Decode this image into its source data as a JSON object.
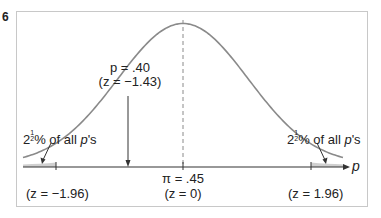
{
  "figure": {
    "corner_mark": "6",
    "x_axis_symbol": "p",
    "center_label_line1": "π = .45",
    "center_label_line2": "(z = 0)",
    "left_z_label": "(z = −1.96)",
    "right_z_label": "(z = 1.96)",
    "sample_label_line1": "p = .40",
    "sample_label_line2": "(z = −1.43)",
    "left_tail_label": {
      "whole": "2",
      "num": "1",
      "den": "2",
      "rest": "% of all ",
      "var": "p",
      "suffix": "'s"
    },
    "right_tail_label": {
      "whole": "2",
      "num": "1",
      "den": "2",
      "rest": "% of all ",
      "var": "p",
      "suffix": "'s"
    }
  },
  "colors": {
    "curve": "#8a8a8a",
    "axis": "#333333",
    "frame": "#c8c8c8",
    "tail_fill": "#d0d0d0",
    "dashed": "#8a8a8a"
  },
  "chart_data": {
    "type": "line",
    "xlabel": "p",
    "ylabel": "",
    "distribution": "normal",
    "mean_label": "π = .45",
    "annotations": [
      {
        "text": "p = .40 (z = −1.43)",
        "z": -1.43
      },
      {
        "text": "2½% of all p's",
        "region": "z < −1.96"
      },
      {
        "text": "2½% of all p's",
        "region": "z > 1.96"
      },
      {
        "text": "(z = −1.96)",
        "z": -1.96
      },
      {
        "text": "(z = 0)",
        "z": 0
      },
      {
        "text": "(z = 1.96)",
        "z": 1.96
      }
    ],
    "grid": false
  }
}
